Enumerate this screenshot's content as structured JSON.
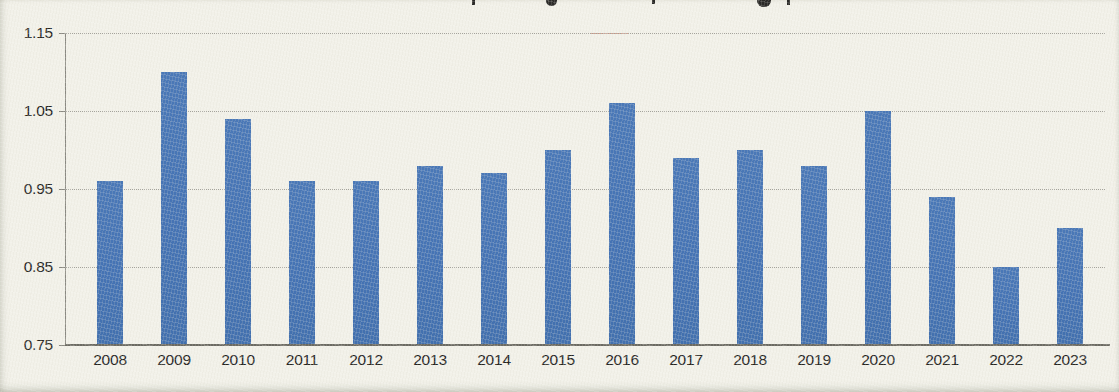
{
  "chart_data": {
    "type": "bar",
    "categories": [
      "2008",
      "2009",
      "2010",
      "2011",
      "2012",
      "2013",
      "2014",
      "2015",
      "2016",
      "2017",
      "2018",
      "2019",
      "2020",
      "2021",
      "2022",
      "2023"
    ],
    "values": [
      0.96,
      1.1,
      1.04,
      0.96,
      0.96,
      0.98,
      0.97,
      1.0,
      1.06,
      0.99,
      1.0,
      0.98,
      1.05,
      0.94,
      0.85,
      0.9
    ],
    "title": "",
    "xlabel": "",
    "ylabel": "",
    "ylim": [
      0.75,
      1.15
    ],
    "yticks": [
      1.15,
      1.05,
      0.95,
      0.85,
      0.75
    ],
    "ytick_labels": [
      "1.15",
      "1.05",
      "0.95",
      "0.85",
      "0.75"
    ],
    "grid": "horizontal-dotted",
    "legend": "none",
    "bar_color": "#4573b4"
  },
  "colors": {
    "paper": "#f2f1e9",
    "bar": "#4573b4",
    "gridline": "#a3a29b",
    "axis": "#8a8982",
    "baseline": "#6b6a62",
    "text": "#26251f",
    "artifact_red": "#cb5c42"
  }
}
